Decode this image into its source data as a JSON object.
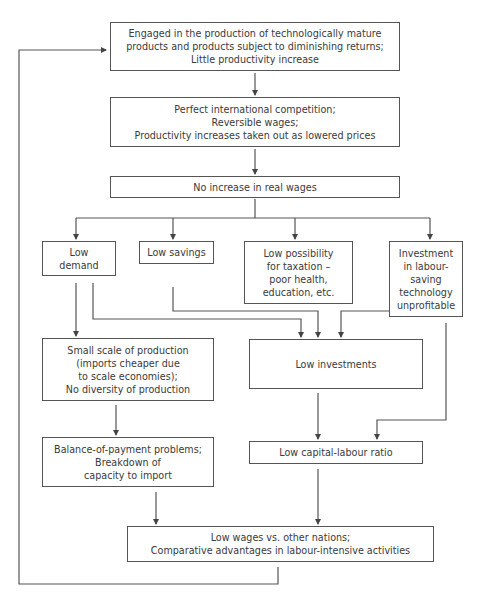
{
  "diagram": {
    "type": "flowchart",
    "nodes": [
      {
        "id": "mature_products",
        "text": "Engaged in the production of technologically mature\nproducts and products subject to diminishing returns;\nLittle productivity increase"
      },
      {
        "id": "perfect_competition",
        "text": "Perfect international competition;\nReversible wages;\nProductivity increases taken out as lowered prices"
      },
      {
        "id": "no_real_wage_increase",
        "text": "No increase in real wages"
      },
      {
        "id": "low_demand",
        "text": "Low\ndemand"
      },
      {
        "id": "low_savings",
        "text": "Low savings"
      },
      {
        "id": "low_taxation",
        "text": "Low possibility\nfor taxation –\npoor health,\neducation, etc."
      },
      {
        "id": "investment_unprofitable",
        "text": "Investment\nin labour-\nsaving\ntechnology\nunprofitable"
      },
      {
        "id": "small_scale",
        "text": "Small scale of production\n(imports cheaper due\nto scale economies);\nNo diversity of production"
      },
      {
        "id": "low_investments",
        "text": "Low investments"
      },
      {
        "id": "balance_of_payment",
        "text": "Balance-of-payment problems;\nBreakdown of\ncapacity to import"
      },
      {
        "id": "low_capital_labour",
        "text": "Low capital-labour ratio"
      },
      {
        "id": "low_wages",
        "text": "Low wages vs. other nations;\nComparative advantages in labour-intensive activities"
      }
    ],
    "edges": [
      {
        "from": "mature_products",
        "to": "perfect_competition"
      },
      {
        "from": "perfect_competition",
        "to": "no_real_wage_increase"
      },
      {
        "from": "no_real_wage_increase",
        "to": "low_demand"
      },
      {
        "from": "no_real_wage_increase",
        "to": "low_savings"
      },
      {
        "from": "no_real_wage_increase",
        "to": "low_taxation"
      },
      {
        "from": "no_real_wage_increase",
        "to": "investment_unprofitable"
      },
      {
        "from": "low_demand",
        "to": "small_scale"
      },
      {
        "from": "low_demand",
        "to": "low_investments"
      },
      {
        "from": "low_savings",
        "to": "low_investments"
      },
      {
        "from": "investment_unprofitable",
        "to": "low_investments"
      },
      {
        "from": "investment_unprofitable",
        "to": "low_capital_labour"
      },
      {
        "from": "small_scale",
        "to": "balance_of_payment"
      },
      {
        "from": "low_investments",
        "to": "low_capital_labour"
      },
      {
        "from": "balance_of_payment",
        "to": "low_wages"
      },
      {
        "from": "low_capital_labour",
        "to": "low_wages"
      },
      {
        "from": "low_wages",
        "to": "mature_products",
        "kind": "feedback-loop"
      }
    ]
  },
  "colors": {
    "line": "#555555",
    "text": "#3a3a3a",
    "background": "#ffffff"
  }
}
